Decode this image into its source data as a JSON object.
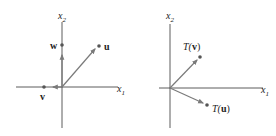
{
  "colors": {
    "axis": "#333333",
    "vector": "#7a7a7a",
    "point": "#555555",
    "text": "#222222"
  },
  "left_panel": {
    "x_axis_label": "x",
    "x_axis_sub": "1",
    "y_axis_label": "x",
    "y_axis_sub": "2",
    "vectors": [
      {
        "name": "u",
        "label": "u"
      },
      {
        "name": "w",
        "label": "w"
      },
      {
        "name": "v",
        "label": "v"
      }
    ]
  },
  "right_panel": {
    "x_axis_label": "x",
    "x_axis_sub": "1",
    "y_axis_label": "x",
    "y_axis_sub": "2",
    "vectors": [
      {
        "name": "T(v)",
        "label_prefix": "T(",
        "label_vec": "v",
        "label_suffix": ")"
      },
      {
        "name": "T(u)",
        "label_prefix": "T(",
        "label_vec": "u",
        "label_suffix": ")"
      }
    ]
  }
}
